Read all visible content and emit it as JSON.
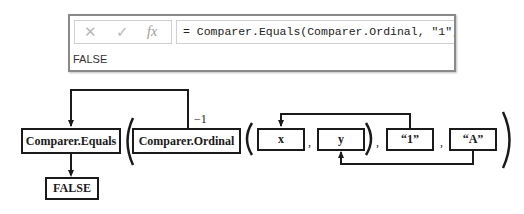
{
  "formula_bar": {
    "cancel_icon": "cross-icon",
    "enter_icon": "check-icon",
    "fx_label": "fx",
    "formula": "= Comparer.Equals(Comparer.Ordinal, \"1\", \"A\")",
    "result": "FALSE"
  },
  "diagram": {
    "function_box": "Comparer.Equals",
    "comparer_box": "Comparer.Ordinal",
    "comparer_result": "−1",
    "param_x": "x",
    "param_y": "y",
    "arg1": "“1”",
    "arg2": "“A”",
    "separator": ",",
    "output_box": "FALSE"
  }
}
